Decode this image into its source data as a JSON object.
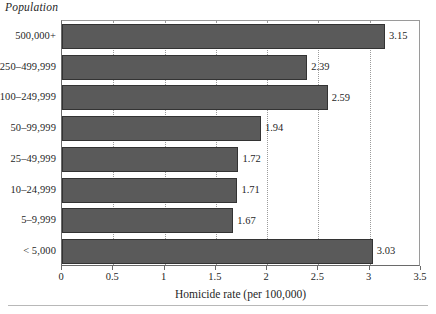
{
  "figure": {
    "y_group_title": "Population",
    "x_axis_title": "Homicide rate (per 100,000)",
    "bar_color": "#5a5a5a",
    "bar_edge_color": "#333333",
    "gridline_color": "#9b9b9b",
    "frame_color": "#888888"
  },
  "chart_data": {
    "type": "bar",
    "orientation": "horizontal",
    "title": "",
    "subtitle": "",
    "xlabel": "Homicide rate (per 100,000)",
    "ylabel": "Population",
    "xlim": [
      0,
      3.5
    ],
    "xticks": [
      "0",
      "0.5",
      "1",
      "1.5",
      "2",
      "2.5",
      "3",
      "3.5"
    ],
    "xtick_values": [
      0,
      0.5,
      1,
      1.5,
      2,
      2.5,
      3,
      3.5
    ],
    "grid": "vertical-dotted",
    "legend": null,
    "categories": [
      "500,000+",
      "250–499,999",
      "100–249,999",
      "50–99,999",
      "25–49,999",
      "10–24,999",
      "5–9,999",
      "< 5,000"
    ],
    "values": [
      3.15,
      2.39,
      2.59,
      1.94,
      1.72,
      1.71,
      1.67,
      3.03
    ],
    "labels": [
      "3.15",
      "2.39",
      "2.59",
      "1.94",
      "1.72",
      "1.71",
      "1.67",
      "3.03"
    ]
  }
}
